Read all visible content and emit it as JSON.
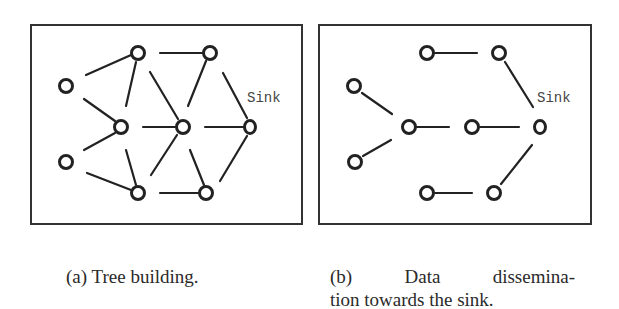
{
  "figure": {
    "panels": [
      {
        "id": "a",
        "caption": "(a) Tree building.",
        "sink_label": "Sink",
        "box": {
          "x": 31,
          "y": 25,
          "w": 271,
          "h": 199
        },
        "nodes": [
          {
            "x": 138,
            "y": 53
          },
          {
            "x": 210,
            "y": 53
          },
          {
            "x": 66,
            "y": 86
          },
          {
            "x": 121,
            "y": 127
          },
          {
            "x": 183,
            "y": 127
          },
          {
            "x": 250,
            "y": 127,
            "sink": true
          },
          {
            "x": 66,
            "y": 162
          },
          {
            "x": 138,
            "y": 193
          },
          {
            "x": 206,
            "y": 193
          }
        ],
        "edges": [
          [
            86,
            75,
            131,
            55
          ],
          [
            126,
            106,
            136,
            62
          ],
          [
            84,
            99,
            115,
            121
          ],
          [
            84,
            150,
            115,
            133
          ],
          [
            87,
            173,
            131,
            190
          ],
          [
            126,
            150,
            136,
            185
          ],
          [
            160,
            53,
            203,
            53
          ],
          [
            150,
            72,
            178,
            119
          ],
          [
            188,
            106,
            206,
            61
          ],
          [
            223,
            73,
            247,
            118
          ],
          [
            143,
            127,
            175,
            127
          ],
          [
            205,
            127,
            243,
            127
          ],
          [
            151,
            175,
            177,
            135
          ],
          [
            190,
            150,
            204,
            185
          ],
          [
            160,
            193,
            198,
            193
          ],
          [
            220,
            181,
            247,
            136
          ]
        ]
      },
      {
        "id": "b",
        "caption_line1": "(b) Data dissemina-",
        "caption_line2": "tion towards the sink.",
        "sink_label": "Sink",
        "box": {
          "x": 319,
          "y": 25,
          "w": 272,
          "h": 199
        },
        "nodes": [
          {
            "x": 427,
            "y": 53
          },
          {
            "x": 499,
            "y": 53
          },
          {
            "x": 354,
            "y": 86
          },
          {
            "x": 409,
            "y": 127
          },
          {
            "x": 472,
            "y": 127
          },
          {
            "x": 540,
            "y": 127,
            "sink": true
          },
          {
            "x": 355,
            "y": 162
          },
          {
            "x": 427,
            "y": 193
          },
          {
            "x": 494,
            "y": 193
          }
        ],
        "edges": [
          [
            435,
            53,
            477,
            53
          ],
          [
            505,
            62,
            533,
            107
          ],
          [
            362,
            93,
            392,
            114
          ],
          [
            363,
            156,
            391,
            140
          ],
          [
            417,
            127,
            449,
            127
          ],
          [
            480,
            127,
            519,
            127
          ],
          [
            435,
            193,
            472,
            193
          ],
          [
            501,
            184,
            532,
            145
          ]
        ]
      }
    ]
  }
}
